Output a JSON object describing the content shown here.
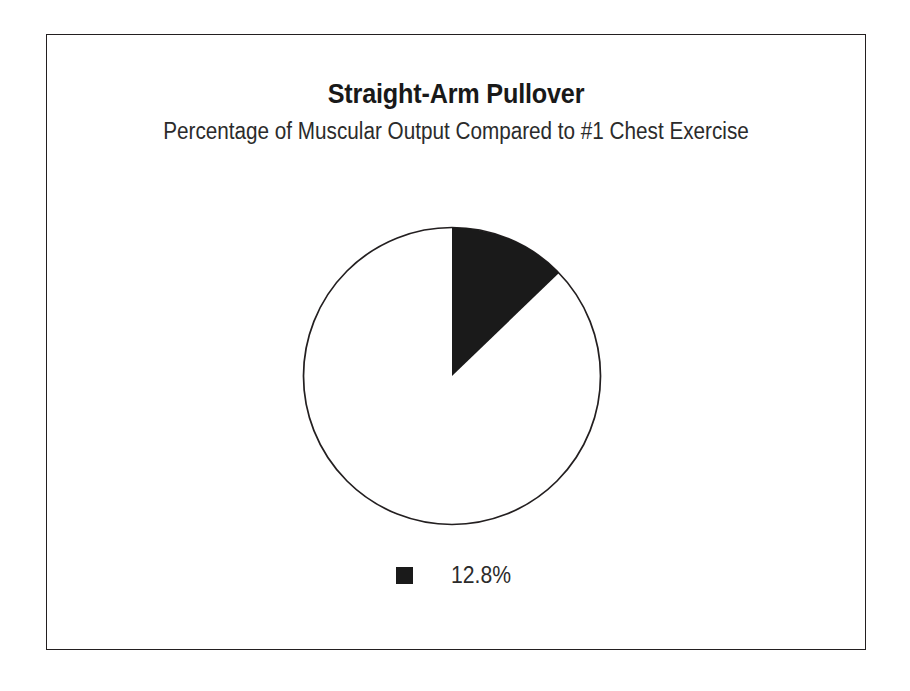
{
  "chart_data": {
    "type": "pie",
    "title": "Straight-Arm Pullover",
    "subtitle": "Percentage of Muscular Output Compared to #1 Chest Exercise",
    "xlabel": "",
    "ylabel": "",
    "categories": [
      "12.8%",
      "Remainder"
    ],
    "values": [
      12.8,
      87.2
    ],
    "slices": [
      {
        "label": "12.8%",
        "value": 12.8,
        "color": "#1a1a1a",
        "start_angle_deg": 0,
        "sweep_angle_deg": 46.08,
        "highlighted": true
      },
      {
        "label": "Remainder",
        "value": 87.2,
        "color": "#ffffff",
        "start_angle_deg": 46.08,
        "sweep_angle_deg": 313.92,
        "highlighted": false
      }
    ],
    "start_angle_deg": 0,
    "direction": "clockwise",
    "legend_position": "bottom",
    "legend_entries": [
      {
        "label": "12.8%",
        "color": "#1a1a1a",
        "swatch": "filled-square"
      }
    ],
    "grid": false,
    "outline_color": "#231f20",
    "background_color": "#ffffff"
  },
  "frame": {
    "border_color": "#231f20",
    "background": "#ffffff"
  },
  "icons": {
    "legend_swatch": "filled-square-icon"
  }
}
